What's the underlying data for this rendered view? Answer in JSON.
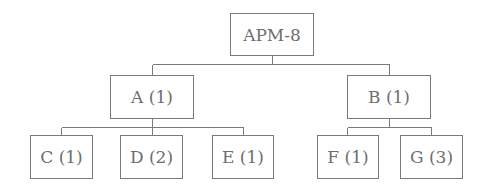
{
  "diagram": {
    "type": "tree",
    "root": {
      "label": "APM-8",
      "children": [
        {
          "label": "A (1)",
          "children": [
            {
              "label": "C (1)"
            },
            {
              "label": "D (2)"
            },
            {
              "label": "E (1)"
            }
          ]
        },
        {
          "label": "B (1)",
          "children": [
            {
              "label": "F (1)"
            },
            {
              "label": "G (3)"
            }
          ]
        }
      ]
    },
    "nodes": {
      "root": "APM-8",
      "a": "A (1)",
      "b": "B (1)",
      "c": "C (1)",
      "d": "D (2)",
      "e": "E (1)",
      "f": "F (1)",
      "g": "G (3)"
    },
    "colors": {
      "line": "#7a7a7a",
      "text": "#6e6e6e",
      "background": "#ffffff"
    }
  }
}
